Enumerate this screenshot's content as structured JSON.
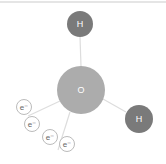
{
  "diagram": {
    "colors": {
      "hydrogen": "#7a7a7a",
      "oxygen": "#acacac",
      "bond": "#dddddd",
      "electron_stroke": "#bbbbbb",
      "top_rule": "#cccccc"
    },
    "atoms": [
      {
        "id": "h1",
        "label": "H",
        "cx": 80,
        "cy": 24,
        "r": 13
      },
      {
        "id": "o",
        "label": "O",
        "cx": 81,
        "cy": 90,
        "r": 24
      },
      {
        "id": "h2",
        "label": "H",
        "cx": 139,
        "cy": 119,
        "r": 14
      }
    ],
    "electrons": [
      {
        "label": "e⁻",
        "cx": 24,
        "cy": 107
      },
      {
        "label": "e⁻",
        "cx": 32,
        "cy": 124
      },
      {
        "label": "e⁻",
        "cx": 50,
        "cy": 137
      },
      {
        "label": "e⁻",
        "cx": 67,
        "cy": 144
      }
    ]
  }
}
